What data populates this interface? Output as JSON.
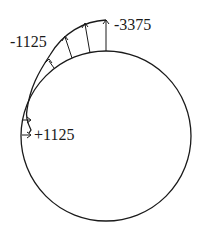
{
  "diagram": {
    "type": "pressure-distribution-on-circle",
    "circle": {
      "cx": 106,
      "cy": 136,
      "r": 85
    },
    "labels": {
      "top": "-3375",
      "upper_left": "-1125",
      "left": "+1125"
    },
    "colors": {
      "line": "#1a1a1a",
      "background": "#ffffff"
    }
  }
}
